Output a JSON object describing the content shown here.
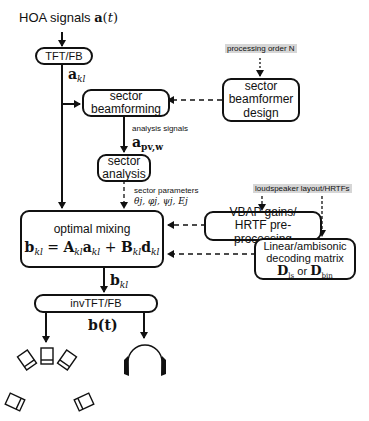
{
  "title_input": {
    "text": "HOA signals",
    "math": "a(t)"
  },
  "blocks": {
    "tft": {
      "label": "TFT/FB"
    },
    "beamforming": {
      "line1": "sector",
      "line2": "beamforming"
    },
    "beamformer_design": {
      "line1": "sector",
      "line2": "beamformer",
      "line3": "design"
    },
    "analysis": {
      "line1": "sector",
      "line2": "analysis"
    },
    "optimal_mixing": {
      "title": "optimal mixing",
      "equation": "b_kl = A_kl a_kl + B_kl d_kl"
    },
    "vbap": {
      "line1": "VBAP gains/",
      "line2": "HRTF pre-processing"
    },
    "decoding": {
      "line1": "Linear/ambisonic",
      "line2": "decoding matrix",
      "or": "or"
    },
    "invtft": {
      "label": "invTFT/FB"
    }
  },
  "labels": {
    "a_kl": "a",
    "a_kl_sub": "kl",
    "processing_order": "processing order N",
    "analysis_signals": "analysis signals",
    "a_pvw": "a",
    "a_pvw_sub": "pv,w",
    "sector_parameters": "sector parameters",
    "sector_param_values": "θj, φj, ψj, Ej",
    "loudspeaker_layout": "loudspeaker layout/HRTFs",
    "b_kl": "b",
    "b_kl_sub": "kl",
    "b_t": "b(t)",
    "D": "D",
    "D_ls_sub": "ls",
    "D_bin_sub": "bin"
  },
  "equation_parts": {
    "b": "b",
    "A": "A",
    "a": "a",
    "B": "B",
    "d": "d",
    "sub": "kl",
    "eq": " = ",
    "plus": " + "
  },
  "outputs": {
    "loudspeakers": "loudspeaker-array",
    "headphones": "headphones"
  },
  "colors": {
    "line": "#111111",
    "highlight": "#d6d6d6",
    "background": "#ffffff"
  }
}
